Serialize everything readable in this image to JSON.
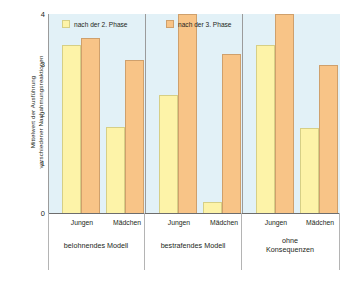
{
  "chart_data": {
    "type": "bar",
    "title": "",
    "xlabel": "",
    "ylabel": "Mittelwert der Ausführung\nverschiedener Nachahmungsreaktionen",
    "ylim": [
      0,
      4
    ],
    "yticks": [
      4,
      3,
      2,
      1,
      0
    ],
    "grid": false,
    "legend_position": "top-left",
    "groups": [
      {
        "label": "belohnendes Modell",
        "categories": [
          "Jungen",
          "Mädchen"
        ]
      },
      {
        "label": "bestrafendes Modell",
        "categories": [
          "Jungen",
          "Mädchen"
        ]
      },
      {
        "label": "ohne\nKonsequenzen",
        "categories": [
          "Jungen",
          "Mädchen"
        ]
      }
    ],
    "categories": [
      "belohnendes Modell – Jungen",
      "belohnendes Modell – Mädchen",
      "bestrafendes Modell – Jungen",
      "bestrafendes Modell – Mädchen",
      "ohne Konsequenzen – Jungen",
      "ohne Konsequenzen – Mädchen"
    ],
    "series": [
      {
        "name": "nach der 2. Phase",
        "color": "#fdf3a8",
        "values": [
          3.37,
          1.72,
          2.37,
          0.23,
          3.37,
          1.7
        ]
      },
      {
        "name": "nach der 3. Phase",
        "color": "#f8c487",
        "values": [
          3.51,
          3.08,
          4.0,
          3.2,
          4.0,
          2.98
        ]
      }
    ]
  },
  "legend": {
    "items": [
      {
        "label": "nach der 2. Phase",
        "swatch": "yellow-swatch-icon"
      },
      {
        "label": "nach der 3. Phase",
        "swatch": "orange-swatch-icon"
      }
    ]
  },
  "axis": {
    "y_title": "Mittelwert der Ausführung\nverschiedener Nachahmungsreaktionen",
    "y_tick_labels": [
      "4",
      "3",
      "2",
      "1",
      "0"
    ]
  },
  "x_axis": {
    "category_labels": [
      "Jungen",
      "Mädchen",
      "Jungen",
      "Mädchen",
      "Jungen",
      "Mädchen"
    ],
    "group_labels": [
      "belohnendes Modell",
      "bestrafendes Modell",
      "ohne\nKonsequenzen"
    ]
  },
  "colors": {
    "plot_background": "#e2f1f7",
    "series_2_phase": "#fdf3a8",
    "series_3_phase": "#f8c487",
    "axis": "#6d6d6d"
  }
}
